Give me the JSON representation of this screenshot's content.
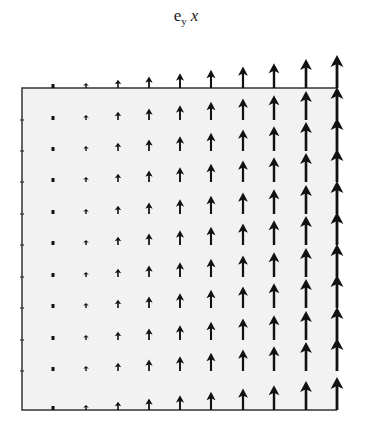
{
  "title": {
    "base": "e",
    "subscript": "y",
    "variable": "x"
  },
  "chart_data": {
    "type": "vector_field",
    "grid": {
      "columns": 10,
      "rows": 11
    },
    "x_positions_px": [
      53,
      86,
      118,
      149,
      180,
      211,
      243,
      274,
      306,
      337
    ],
    "row_base_y_px": [
      88,
      120,
      151,
      182,
      214,
      245,
      277,
      308,
      340,
      371,
      410
    ],
    "relative_magnitude": [
      0.05,
      0.15,
      0.25,
      0.35,
      0.45,
      0.55,
      0.65,
      0.75,
      0.88,
      1.0
    ],
    "direction": "up",
    "box": {
      "left": 22,
      "top": 88,
      "right": 337,
      "bottom": 410
    },
    "left_axis_ticks_y_px": [
      120,
      151,
      182,
      214,
      245,
      277,
      308,
      340,
      371
    ],
    "colors": {
      "arrow": "#111111",
      "box_fill": "#f2f2f2",
      "box_stroke": "#333333"
    },
    "xlabel": "",
    "ylabel": ""
  }
}
